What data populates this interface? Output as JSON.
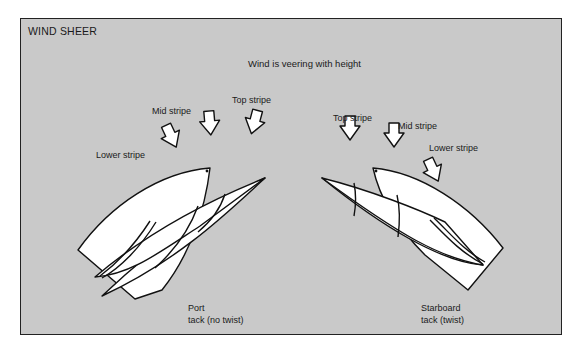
{
  "title": "WIND SHEER",
  "subtitle": "Wind is veering with height",
  "colors": {
    "panel_background": "#c9c9c9",
    "border": "#222222",
    "sail_fill": "#ffffff",
    "text": "#1a1a1a"
  },
  "port_tack": {
    "arrow_labels": {
      "lower": "Lower stripe",
      "mid": "Mid stripe",
      "top": "Top stripe"
    },
    "caption_line1": "Port",
    "caption_line2": "tack (no twist)"
  },
  "starboard_tack": {
    "arrow_labels": {
      "top": "Top stripe",
      "mid": "Mid stripe",
      "lower": "Lower stripe"
    },
    "caption_line1": "Starboard",
    "caption_line2": "tack (twist)"
  }
}
